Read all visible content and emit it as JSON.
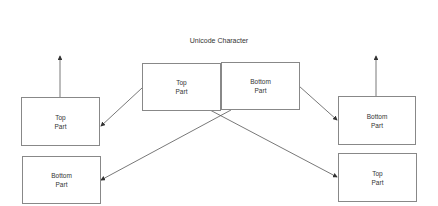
{
  "title": "Unicode Character",
  "boxes": {
    "center_top": "Top\nPart",
    "center_bottom": "Bottom\nPart",
    "left_top": "Top\nPart",
    "left_bottom": "Bottom\nPart",
    "right_bottom": "Bottom\nPart",
    "right_top": "Top\nPart"
  },
  "colors": {
    "line": "#555555",
    "border": "#888888"
  }
}
